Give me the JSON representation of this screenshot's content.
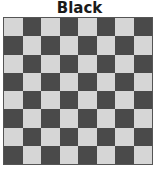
{
  "title": "Black",
  "board": {
    "rows": 8,
    "cols": 8,
    "top_left_color": "light",
    "colors": {
      "light": "#d6d6d6",
      "dark": "#4a4a4a",
      "border": "#555555"
    },
    "pieces": []
  }
}
